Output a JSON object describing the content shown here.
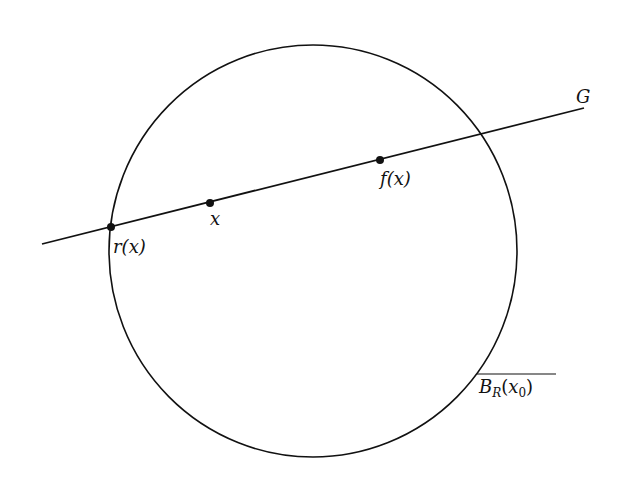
{
  "diagram": {
    "stroke_color": "#111111",
    "background": "#ffffff",
    "labels": {
      "line": "G",
      "ball_main": "B",
      "ball_sub": "R",
      "ball_open": "(",
      "ball_arg": "x",
      "ball_arg_sub": "0",
      "ball_close": ")",
      "point_r": "r(x)",
      "point_x": "x",
      "point_f": "f(x)"
    }
  }
}
